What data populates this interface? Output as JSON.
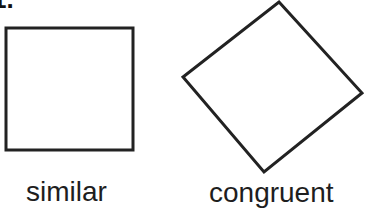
{
  "problem": {
    "number_label": "1."
  },
  "shapes": [
    {
      "name": "square",
      "orientation": "axis-aligned",
      "points": [
        [
          6,
          28
        ],
        [
          133,
          28
        ],
        [
          133,
          150
        ],
        [
          6,
          150
        ]
      ]
    },
    {
      "name": "rotated-square",
      "orientation": "rotated",
      "points": [
        [
          279,
          2
        ],
        [
          362,
          93
        ],
        [
          264,
          172
        ],
        [
          183,
          77
        ]
      ]
    }
  ],
  "labels": {
    "left": "similar",
    "right": "congruent"
  },
  "colors": {
    "stroke": "#222222",
    "text": "#1e1e1e",
    "background": "#ffffff"
  }
}
